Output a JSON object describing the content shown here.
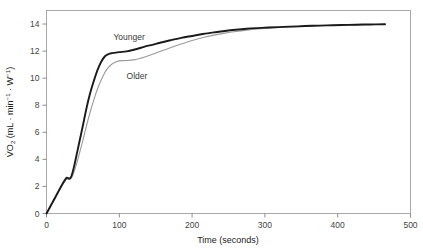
{
  "chart_data": {
    "type": "line",
    "title": "",
    "xlabel": "Time (seconds)",
    "ylabel": "V̇O2 (mL · min−1 · W−1)",
    "ylabel_parts": {
      "v_dot": "V̇",
      "o": "O",
      "o_sub": "2",
      "open": " (mL · min",
      "sup1": "−1",
      "mid": " · W",
      "sup2": "−1",
      "close": ")"
    },
    "xlim": [
      0,
      500
    ],
    "ylim": [
      0,
      15
    ],
    "xticks": [
      0,
      100,
      200,
      300,
      400,
      500
    ],
    "xtick_labels": [
      "0",
      "100",
      "200",
      "300",
      "400",
      "500"
    ],
    "yticks": [
      0,
      2,
      4,
      6,
      8,
      10,
      12,
      14
    ],
    "ytick_labels": [
      "0",
      "2",
      "4",
      "6",
      "8",
      "10",
      "12",
      "14"
    ],
    "grid": false,
    "legend_position": "inline-annotations",
    "annotations": [
      {
        "text": "Younger",
        "x": 92,
        "y": 12.85
      },
      {
        "text": "Older",
        "x": 110,
        "y": 9.95
      }
    ],
    "series": [
      {
        "name": "Younger",
        "color": "#1a1a1a",
        "line_width": 1.9,
        "x": [
          0,
          5,
          10,
          15,
          20,
          25,
          28,
          31,
          34,
          38,
          42,
          46,
          50,
          55,
          60,
          65,
          70,
          75,
          80,
          85,
          90,
          100,
          110,
          120,
          130,
          140,
          155,
          170,
          185,
          200,
          215,
          230,
          245,
          260,
          275,
          290,
          305,
          325,
          345,
          365,
          385,
          405,
          425,
          445,
          465
        ],
        "y": [
          0,
          0.5,
          1.0,
          1.5,
          2.0,
          2.45,
          2.65,
          2.58,
          2.72,
          3.5,
          4.5,
          5.5,
          6.5,
          7.8,
          8.9,
          9.8,
          10.6,
          11.2,
          11.6,
          11.78,
          11.85,
          11.92,
          11.98,
          12.1,
          12.25,
          12.4,
          12.6,
          12.8,
          12.98,
          13.12,
          13.26,
          13.38,
          13.49,
          13.58,
          13.65,
          13.7,
          13.74,
          13.79,
          13.83,
          13.87,
          13.9,
          13.93,
          13.95,
          13.97,
          13.98
        ]
      },
      {
        "name": "Older",
        "color": "#9a9a9a",
        "line_width": 1.1,
        "x": [
          0,
          5,
          10,
          15,
          20,
          25,
          28,
          31,
          34,
          38,
          42,
          46,
          50,
          55,
          60,
          65,
          70,
          75,
          80,
          85,
          90,
          95,
          100,
          105,
          110,
          120,
          130,
          140,
          155,
          170,
          185,
          200,
          215,
          230,
          245,
          260,
          275,
          290,
          305,
          325,
          345,
          365,
          385,
          405,
          425,
          445,
          465
        ],
        "y": [
          0,
          0.45,
          0.92,
          1.42,
          1.92,
          2.35,
          2.55,
          2.5,
          2.6,
          3.1,
          3.8,
          4.6,
          5.4,
          6.5,
          7.5,
          8.4,
          9.2,
          9.85,
          10.4,
          10.8,
          11.05,
          11.2,
          11.28,
          11.3,
          11.3,
          11.35,
          11.48,
          11.65,
          11.95,
          12.25,
          12.52,
          12.78,
          13.0,
          13.18,
          13.33,
          13.45,
          13.55,
          13.63,
          13.69,
          13.76,
          13.81,
          13.85,
          13.89,
          13.92,
          13.94,
          13.96,
          13.98
        ]
      }
    ]
  },
  "figure": {
    "background": "#ffffff",
    "frame_color": "#a0a0a0",
    "axis_color": "#808080",
    "text_color": "#333333"
  }
}
